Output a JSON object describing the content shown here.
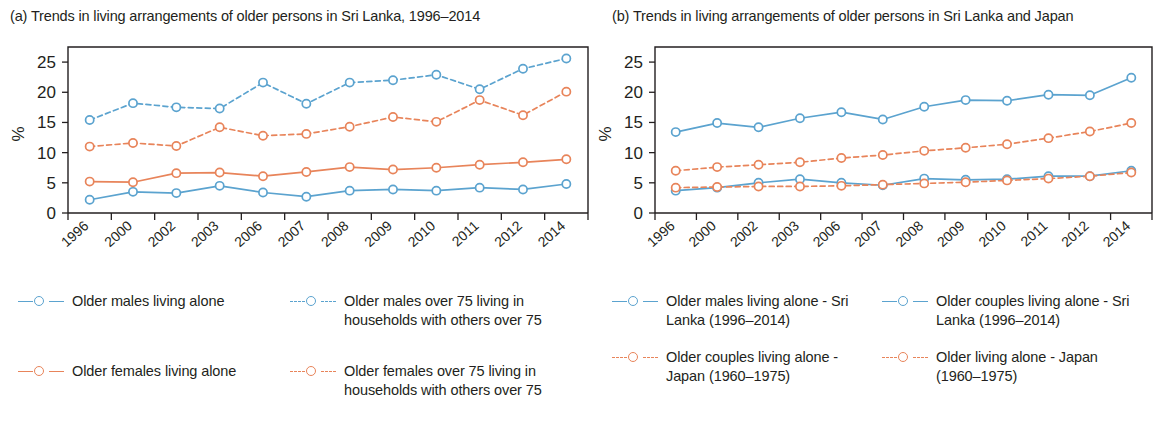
{
  "colors": {
    "blue": "#5ba3cf",
    "orange": "#e8845a",
    "axis": "#231f20"
  },
  "panel_a": {
    "title": "(a) Trends in living arrangements of older persons in Sri Lanka, 1996–2014",
    "ylabel": "%",
    "legend": [
      {
        "label": "Older males living alone",
        "color_key": "blue",
        "style": "solid",
        "marker": "open-circle"
      },
      {
        "label": "Older males over 75 living in households with others over 75",
        "color_key": "blue",
        "style": "dashed",
        "marker": "open-circle"
      },
      {
        "label": "Older females living alone",
        "color_key": "orange",
        "style": "solid",
        "marker": "open-circle"
      },
      {
        "label": "Older females over 75 living in households with others over 75",
        "color_key": "orange",
        "style": "dashed",
        "marker": "open-circle"
      }
    ]
  },
  "panel_b": {
    "title": "(b) Trends in living arrangements of older persons in Sri Lanka and Japan",
    "ylabel": "%",
    "legend": [
      {
        "label": "Older males living alone - Sri Lanka (1996–2014)",
        "color_key": "blue",
        "style": "solid",
        "marker": "open-circle"
      },
      {
        "label": "Older couples living alone - Sri Lanka (1996–2014)",
        "color_key": "blue",
        "style": "solid",
        "marker": "open-circle"
      },
      {
        "label": "Older couples living alone - Japan (1960–1975)",
        "color_key": "orange",
        "style": "dashed",
        "marker": "open-circle"
      },
      {
        "label": "Older living alone - Japan (1960–1975)",
        "color_key": "orange",
        "style": "dashed",
        "marker": "open-circle"
      }
    ]
  },
  "chart_data": [
    {
      "type": "line",
      "id": "panel-a",
      "title": "(a) Trends in living arrangements of older persons in Sri Lanka, 1996–2014",
      "xlabel": "",
      "ylabel": "%",
      "ylim": [
        0,
        27.5
      ],
      "yticks": [
        0,
        5,
        10,
        15,
        20,
        25
      ],
      "grid": false,
      "legend_position": "below",
      "categories": [
        "1996",
        "2000",
        "2002",
        "2003",
        "2006",
        "2007",
        "2008",
        "2009",
        "2010",
        "2011",
        "2012",
        "2014"
      ],
      "series": [
        {
          "name": "Older males living alone",
          "color": "#5ba3cf",
          "style": "solid",
          "values": [
            2.2,
            3.5,
            3.3,
            4.5,
            3.4,
            2.7,
            3.7,
            3.9,
            3.7,
            4.2,
            3.9,
            4.8
          ]
        },
        {
          "name": "Older females living alone",
          "color": "#e8845a",
          "style": "solid",
          "values": [
            5.2,
            5.1,
            6.6,
            6.7,
            6.1,
            6.8,
            7.6,
            7.2,
            7.5,
            8.0,
            8.4,
            8.9
          ]
        },
        {
          "name": "Older males over 75 living in households with others over 75",
          "color": "#5ba3cf",
          "style": "dashed",
          "values": [
            15.4,
            18.2,
            17.5,
            17.3,
            21.6,
            18.1,
            21.6,
            22.0,
            22.9,
            20.5,
            23.9,
            25.6
          ]
        },
        {
          "name": "Older females over 75 living in households with others over 75",
          "color": "#e8845a",
          "style": "dashed",
          "values": [
            11.0,
            11.6,
            11.1,
            14.2,
            12.8,
            13.1,
            14.3,
            15.9,
            15.1,
            18.7,
            16.2,
            20.1
          ]
        }
      ]
    },
    {
      "type": "line",
      "id": "panel-b",
      "title": "(b) Trends in living arrangements of older persons in Sri Lanka and Japan",
      "xlabel": "",
      "ylabel": "%",
      "ylim": [
        0,
        27.5
      ],
      "yticks": [
        0,
        5,
        10,
        15,
        20,
        25
      ],
      "grid": false,
      "legend_position": "below",
      "categories": [
        "1996",
        "2000",
        "2002",
        "2003",
        "2006",
        "2007",
        "2008",
        "2009",
        "2010",
        "2011",
        "2012",
        "2014"
      ],
      "series": [
        {
          "name": "Older couples living alone - Sri Lanka (1996–2014)",
          "color": "#5ba3cf",
          "style": "solid",
          "values": [
            13.4,
            14.9,
            14.2,
            15.7,
            16.7,
            15.5,
            17.6,
            18.7,
            18.6,
            19.6,
            19.5,
            22.4
          ]
        },
        {
          "name": "Older couples living alone - Japan (1960–1975)",
          "color": "#e8845a",
          "style": "dashed",
          "values": [
            7.0,
            7.6,
            8.0,
            8.4,
            9.1,
            9.6,
            10.3,
            10.8,
            11.4,
            12.4,
            13.5,
            14.9
          ]
        },
        {
          "name": "Older males living alone - Sri Lanka (1996–2014)",
          "color": "#5ba3cf",
          "style": "solid",
          "values": [
            3.7,
            4.2,
            5.0,
            5.6,
            5.0,
            4.6,
            5.7,
            5.5,
            5.6,
            6.1,
            6.1,
            7.0
          ]
        },
        {
          "name": "Older living alone - Japan (1960–1975)",
          "color": "#e8845a",
          "style": "dashed",
          "values": [
            4.2,
            4.3,
            4.4,
            4.4,
            4.5,
            4.7,
            4.9,
            5.1,
            5.4,
            5.7,
            6.1,
            6.7
          ]
        }
      ]
    }
  ]
}
